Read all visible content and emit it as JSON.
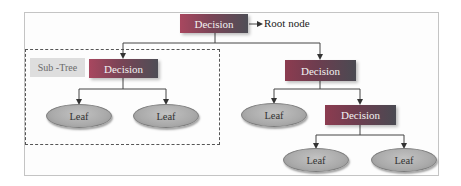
{
  "diagram": {
    "type": "decision-tree",
    "root": {
      "label": "Decision",
      "annotation": "Root node"
    },
    "subtree_label": "Sub -Tree",
    "left_branch": {
      "decision": "Decision",
      "leaves": [
        "Leaf",
        "Leaf"
      ]
    },
    "right_branch": {
      "decision": "Decision",
      "leaf": "Leaf",
      "sub_decision": "Decision",
      "sub_leaves": [
        "Leaf",
        "Leaf"
      ]
    },
    "colors": {
      "decision_start": "#a8475f",
      "decision_end": "#4e4e56",
      "leaf_fill": "#aaaaaa",
      "subtree_label_bg": "#dedede",
      "line": "#333333"
    }
  }
}
